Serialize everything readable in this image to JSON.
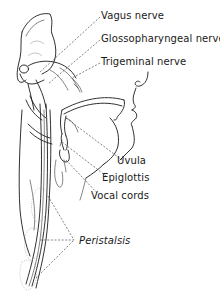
{
  "figure": {
    "line_color": "#1a1a1a",
    "background": "#ffffff"
  },
  "labels": {
    "vagus": "Vagus nerve",
    "glossopharyngeal": "Glossopharyngeal nerve",
    "trigeminal": "Trigeminal nerve",
    "uvula": "Uvula",
    "epiglottis": "Epiglottis",
    "vocal_cords": "Vocal cords",
    "peristalsis": "Peristalsis"
  }
}
